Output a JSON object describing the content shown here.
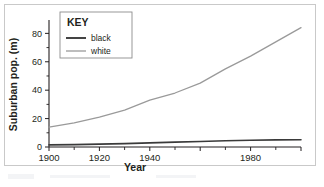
{
  "chart_data": {
    "type": "line",
    "title": "",
    "xlabel": "Year",
    "ylabel": "Suburban pop. (m)",
    "xlim": [
      1900,
      2000
    ],
    "ylim": [
      0,
      88
    ],
    "grid": false,
    "legend_position": "top-left-inside",
    "legend_title": "KEY",
    "x_ticks_major": [
      1900,
      1920,
      1940,
      1960,
      1980,
      2000
    ],
    "x_tick_labels": [
      "1900",
      "1920",
      "1940",
      "",
      "1980",
      ""
    ],
    "x_ticks_minor": [
      1910,
      1930,
      1950,
      1970,
      1990
    ],
    "y_ticks_major": [
      0,
      20,
      40,
      60,
      80
    ],
    "y_tick_labels": [
      "0",
      "20",
      "40",
      "60",
      "80"
    ],
    "y_ticks_minor": [
      10,
      30,
      50,
      70
    ],
    "x": [
      1900,
      1910,
      1920,
      1930,
      1940,
      1950,
      1960,
      1970,
      1980,
      1990,
      2000
    ],
    "series": [
      {
        "name": "black",
        "color": "#3a3a3a",
        "values": [
          1.5,
          1.7,
          2.0,
          2.4,
          2.9,
          3.4,
          3.9,
          4.4,
          4.8,
          5.0,
          5.1
        ]
      },
      {
        "name": "white",
        "color": "#9a9a9a",
        "values": [
          14,
          17,
          21,
          26,
          33,
          38,
          45,
          55,
          64,
          74,
          84
        ]
      }
    ]
  },
  "axis": {
    "y_title": "Suburban pop. (m)",
    "x_title": "Year"
  },
  "legend": {
    "title": "KEY",
    "entries": [
      {
        "label": "black"
      },
      {
        "label": "white"
      }
    ]
  },
  "colors": {
    "frame": "#c9c9c9",
    "axis": "#231f20",
    "black_series": "#3a3a3a",
    "white_series": "#9a9a9a",
    "text": "#231f20"
  }
}
